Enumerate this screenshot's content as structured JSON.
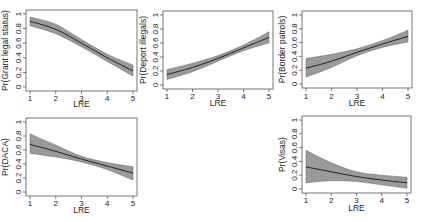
{
  "chart_data": [
    {
      "type": "line",
      "title": "",
      "xlabel": "LRE",
      "ylabel": "Pr(Grant legal status)",
      "x": [
        1,
        2,
        3,
        4,
        5
      ],
      "xlim": [
        1,
        5
      ],
      "ylim": [
        0,
        1
      ],
      "xticks": [
        "1",
        "2",
        "3",
        "4",
        "5"
      ],
      "yticks": [
        "0",
        "0.2",
        "0.4",
        "0.6",
        "0.8",
        "1"
      ],
      "grid": false,
      "series": [
        {
          "name": "predicted",
          "values": [
            0.9,
            0.79,
            0.6,
            0.4,
            0.22
          ]
        },
        {
          "name": "ci_lower",
          "values": [
            0.84,
            0.73,
            0.55,
            0.35,
            0.15
          ]
        },
        {
          "name": "ci_upper",
          "values": [
            0.96,
            0.86,
            0.65,
            0.45,
            0.3
          ]
        }
      ]
    },
    {
      "type": "line",
      "title": "",
      "xlabel": "LRE",
      "ylabel": "Pr(Deport illegals)",
      "x": [
        1,
        2,
        3,
        4,
        5
      ],
      "xlim": [
        1,
        5
      ],
      "ylim": [
        0,
        1
      ],
      "xticks": [
        "1",
        "2",
        "3",
        "4",
        "5"
      ],
      "yticks": [
        "0",
        "0.2",
        "0.4",
        "0.6",
        "0.8",
        "1"
      ],
      "grid": false,
      "series": [
        {
          "name": "predicted",
          "values": [
            0.15,
            0.25,
            0.38,
            0.53,
            0.68
          ]
        },
        {
          "name": "ci_lower",
          "values": [
            0.08,
            0.19,
            0.34,
            0.49,
            0.6
          ]
        },
        {
          "name": "ci_upper",
          "values": [
            0.22,
            0.31,
            0.42,
            0.57,
            0.76
          ]
        }
      ]
    },
    {
      "type": "line",
      "title": "",
      "xlabel": "LRE",
      "ylabel": "Pr(Border patrols)",
      "x": [
        1,
        2,
        3,
        4,
        5
      ],
      "xlim": [
        1,
        5
      ],
      "ylim": [
        0,
        1
      ],
      "xticks": [
        "1",
        "2",
        "3",
        "4",
        "5"
      ],
      "yticks": [
        "0",
        "0.2",
        "0.4",
        "0.6",
        "0.8",
        "1"
      ],
      "grid": false,
      "series": [
        {
          "name": "predicted",
          "values": [
            0.23,
            0.33,
            0.46,
            0.58,
            0.69
          ]
        },
        {
          "name": "ci_lower",
          "values": [
            0.1,
            0.24,
            0.41,
            0.53,
            0.61
          ]
        },
        {
          "name": "ci_upper",
          "values": [
            0.37,
            0.43,
            0.51,
            0.63,
            0.78
          ]
        }
      ]
    },
    {
      "type": "line",
      "title": "",
      "xlabel": "LRE",
      "ylabel": "Pr(DACA)",
      "x": [
        1,
        2,
        3,
        4,
        5
      ],
      "xlim": [
        1,
        5
      ],
      "ylim": [
        0,
        1
      ],
      "xticks": [
        "1",
        "2",
        "3",
        "4",
        "5"
      ],
      "yticks": [
        "0",
        "0.2",
        "0.4",
        "0.6",
        "0.8",
        "1"
      ],
      "grid": false,
      "series": [
        {
          "name": "predicted",
          "values": [
            0.68,
            0.58,
            0.47,
            0.37,
            0.27
          ]
        },
        {
          "name": "ci_lower",
          "values": [
            0.55,
            0.5,
            0.43,
            0.32,
            0.17
          ]
        },
        {
          "name": "ci_upper",
          "values": [
            0.83,
            0.67,
            0.51,
            0.42,
            0.36
          ]
        }
      ]
    },
    {
      "type": "line",
      "title": "",
      "xlabel": "LRE",
      "ylabel": "Pr(Visas)",
      "x": [
        1,
        2,
        3,
        4,
        5
      ],
      "xlim": [
        1,
        5
      ],
      "ylim": [
        0,
        1
      ],
      "xticks": [
        "1",
        "2",
        "3",
        "4",
        "5"
      ],
      "yticks": [
        "0",
        "0.2",
        "0.4",
        "0.6",
        "0.8",
        "1"
      ],
      "grid": false,
      "series": [
        {
          "name": "predicted",
          "values": [
            0.32,
            0.25,
            0.18,
            0.13,
            0.09
          ]
        },
        {
          "name": "ci_lower",
          "values": [
            0.09,
            0.12,
            0.11,
            0.06,
            0.01
          ]
        },
        {
          "name": "ci_upper",
          "values": [
            0.56,
            0.38,
            0.25,
            0.2,
            0.17
          ]
        }
      ]
    }
  ],
  "panels_layout": [
    {
      "left": 26,
      "top": 10,
      "right": 137,
      "bottom": 91,
      "label_x": 8,
      "tick_y": 98,
      "xlabel_y": 107
    },
    {
      "left": 163,
      "top": 11,
      "right": 273,
      "bottom": 89,
      "label_x": 146,
      "tick_y": 96,
      "xlabel_y": 106
    },
    {
      "left": 302,
      "top": 11,
      "right": 412,
      "bottom": 88,
      "label_x": 285,
      "tick_y": 96,
      "xlabel_y": 106
    },
    {
      "left": 26,
      "top": 118,
      "right": 137,
      "bottom": 196,
      "label_x": 8,
      "tick_y": 203,
      "xlabel_y": 213
    },
    {
      "left": 302,
      "top": 116,
      "right": 411,
      "bottom": 193,
      "label_x": 285,
      "tick_y": 200,
      "xlabel_y": 211
    }
  ],
  "colors": {
    "band": "#9a9a9a",
    "line": "#222222",
    "frame": "#555555"
  }
}
